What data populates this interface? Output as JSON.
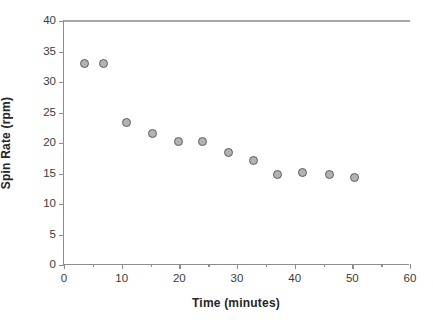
{
  "chart_data": {
    "type": "scatter",
    "title": "",
    "xlabel": "Time (minutes)",
    "ylabel": "Spin Rate (rpm)",
    "xlim": [
      0,
      60
    ],
    "ylim": [
      0,
      40
    ],
    "xticks": [
      0,
      10,
      20,
      30,
      40,
      50,
      60
    ],
    "yticks": [
      0,
      5,
      10,
      15,
      20,
      25,
      30,
      35,
      40
    ],
    "xtick_labels": [
      "0",
      "10",
      "20",
      "30",
      "40",
      "50",
      "60"
    ],
    "ytick_labels": [
      "0",
      "5",
      "10",
      "15",
      "20",
      "25",
      "30",
      "35",
      "40"
    ],
    "x_minor_step": 5,
    "grid": false,
    "legend": null,
    "series": [
      {
        "name": "Spin Rate",
        "marker": "circle",
        "marker_fill": "#b3b3b3",
        "marker_edge": "#5e5e5e",
        "x": [
          3.6,
          6.9,
          10.9,
          15.4,
          19.8,
          24.1,
          28.6,
          32.8,
          37.1,
          41.3,
          46.1,
          50.3
        ],
        "y": [
          33.0,
          33.0,
          23.3,
          21.5,
          20.3,
          20.3,
          18.4,
          17.2,
          14.8,
          15.1,
          14.8,
          14.4
        ]
      }
    ],
    "axis_color": "#8d8d8d",
    "background": "#ffffff"
  }
}
